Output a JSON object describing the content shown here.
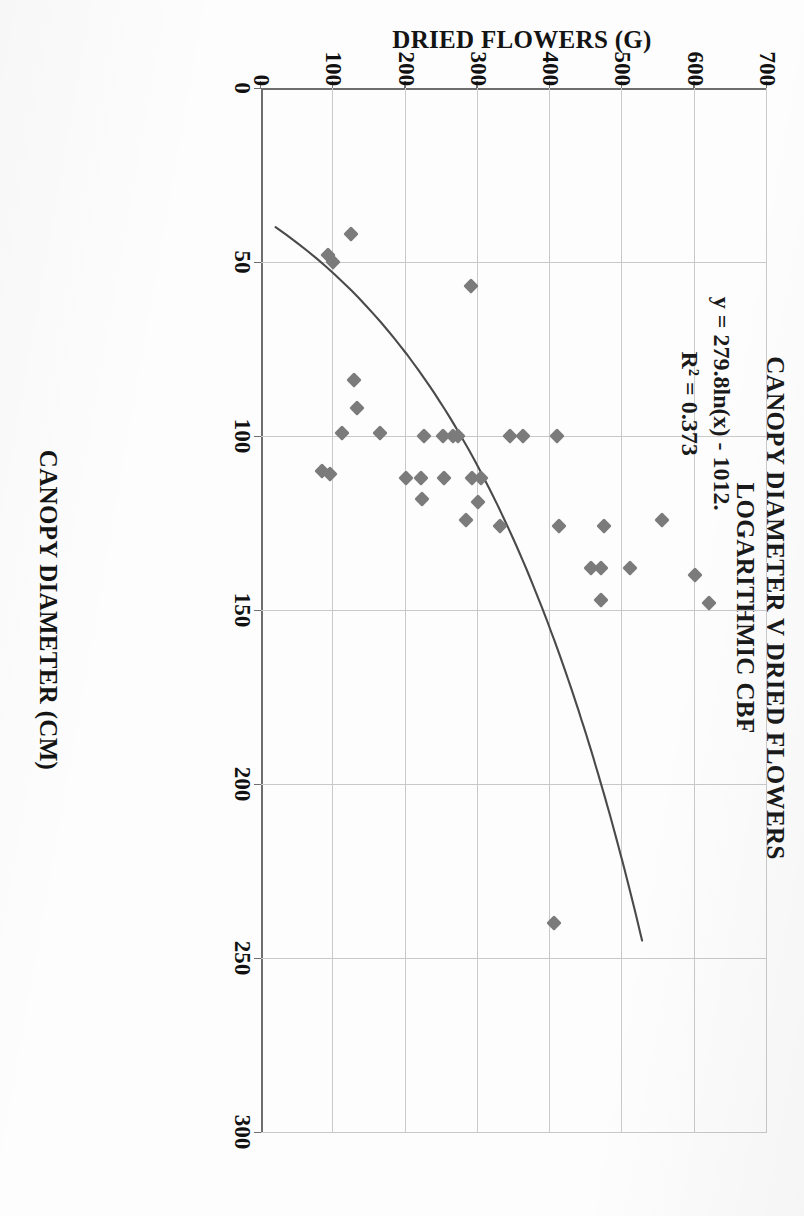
{
  "chart_data": {
    "type": "scatter",
    "title": "CANOPY DIAMETER V DRIED FLOWERS",
    "subtitle": "LOGARITHMIC CBF",
    "xlabel": "CANOPY DIAMETER (CM)",
    "ylabel": "DRIED FLOWERS (G)",
    "xlim": [
      0,
      300
    ],
    "ylim": [
      0,
      700
    ],
    "xticks": [
      "0",
      "50",
      "100",
      "150",
      "200",
      "250",
      "300"
    ],
    "yticks": [
      "0",
      "100",
      "200",
      "300",
      "400",
      "500",
      "600",
      "700"
    ],
    "grid": "vertical-and-baseline",
    "legend": "none",
    "annotations": {
      "equation": "y = 279.8ln(x) - 1012.",
      "r_squared": "R² = 0.373"
    },
    "trendline": {
      "type": "logarithmic",
      "label": "y = 279.8ln(x) - 1012.",
      "r2": 0.373,
      "coef_a": 279.8,
      "coef_b": -1012,
      "x_start": 40,
      "x_end": 245
    },
    "series": [
      {
        "name": "Dried flowers vs canopy diameter",
        "marker": "diamond",
        "color": "#7b7b7b",
        "points": [
          [
            42,
            125
          ],
          [
            48,
            93
          ],
          [
            50,
            100
          ],
          [
            57,
            290
          ],
          [
            84,
            128
          ],
          [
            92,
            133
          ],
          [
            99,
            112
          ],
          [
            99,
            165
          ],
          [
            100,
            225
          ],
          [
            100,
            252
          ],
          [
            100,
            265
          ],
          [
            100,
            272
          ],
          [
            100,
            345
          ],
          [
            100,
            362
          ],
          [
            100,
            410
          ],
          [
            110,
            85
          ],
          [
            111,
            96
          ],
          [
            112,
            200
          ],
          [
            112,
            222
          ],
          [
            112,
            253
          ],
          [
            112,
            292
          ],
          [
            112,
            305
          ],
          [
            118,
            223
          ],
          [
            119,
            300
          ],
          [
            124,
            283
          ],
          [
            126,
            330
          ],
          [
            126,
            412
          ],
          [
            126,
            475
          ],
          [
            124,
            555
          ],
          [
            138,
            457
          ],
          [
            138,
            470
          ],
          [
            138,
            510
          ],
          [
            140,
            600
          ],
          [
            147,
            470
          ],
          [
            148,
            620
          ],
          [
            240,
            405
          ]
        ]
      }
    ]
  },
  "axis_title_x": "CANOPY DIAMETER (CM)",
  "axis_title_y": "DRIED FLOWERS (G)"
}
